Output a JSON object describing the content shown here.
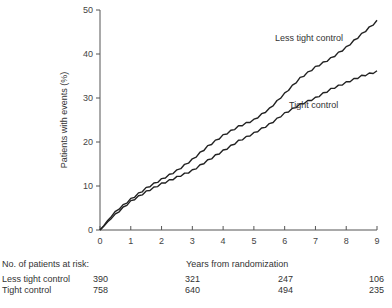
{
  "chart_data": {
    "type": "line",
    "title": "",
    "xlabel": "Years from randomization",
    "ylabel": "Patients with events (%)",
    "xlim": [
      0,
      9
    ],
    "ylim": [
      0,
      50
    ],
    "x_ticks": [
      0,
      1,
      2,
      3,
      4,
      5,
      6,
      7,
      8,
      9
    ],
    "y_ticks": [
      0,
      10,
      20,
      30,
      40,
      50
    ],
    "grid": false,
    "legend": "inline labels",
    "x": [
      0,
      0.5,
      1,
      1.5,
      2,
      2.5,
      3,
      3.5,
      4,
      4.5,
      5,
      5.5,
      6,
      6.5,
      7,
      7.5,
      8,
      8.5,
      9
    ],
    "series": [
      {
        "name": "Less tight control",
        "label_position": {
          "x": 6.2,
          "y": 43
        },
        "values": [
          0,
          4.2,
          7,
          9.5,
          11.5,
          13.5,
          16,
          19,
          21.5,
          23.5,
          25,
          27.5,
          31,
          34.5,
          37,
          39,
          41.5,
          44.5,
          47.5
        ]
      },
      {
        "name": "Tight control",
        "label_position": {
          "x": 6.8,
          "y": 26
        },
        "values": [
          0,
          3.6,
          6.5,
          8.7,
          10.5,
          12,
          13.5,
          15.8,
          18,
          20.2,
          22,
          24,
          26.5,
          28.5,
          30,
          32,
          33.5,
          35,
          36
        ]
      }
    ],
    "risk_table": {
      "title": "No. of patients at risk:",
      "columns_years": [
        0,
        3,
        6,
        9
      ],
      "rows": [
        {
          "group": "Less tight control",
          "values": [
            390,
            321,
            247,
            106
          ]
        },
        {
          "group": "Tight control",
          "values": [
            758,
            640,
            494,
            235
          ]
        }
      ]
    }
  },
  "labels": {
    "ylabel": "Patients with events (%)",
    "xlabel": "Years from randomization",
    "less_tight": "Less tight control",
    "tight": "Tight control"
  },
  "risk": {
    "title": "No. of patients at risk:",
    "row1_name": "Less tight control",
    "row1_v0": "390",
    "row1_v1": "321",
    "row1_v2": "247",
    "row1_v3": "106",
    "row2_name": "Tight control",
    "row2_v0": "758",
    "row2_v1": "640",
    "row2_v2": "494",
    "row2_v3": "235"
  },
  "colors": {
    "line": "#222222",
    "axis": "#555555",
    "text": "#333333"
  }
}
